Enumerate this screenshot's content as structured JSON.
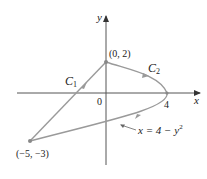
{
  "figure": {
    "axes": {
      "x_label": "x",
      "y_label": "y",
      "origin_label": "0",
      "x_tick_label": "4",
      "axis_color": "#555555"
    },
    "curves": {
      "C1": {
        "label": "C",
        "subscript": "1",
        "from": "(-5, -3)",
        "to": "(0, 2)",
        "type": "line segment"
      },
      "C2": {
        "label": "C",
        "subscript": "2",
        "type": "parabolic arc",
        "equation_lhs": "x = 4 − y",
        "equation_exp": "2"
      },
      "curve_color": "#9a9a9a"
    },
    "points": [
      {
        "label": "(0, 2)"
      },
      {
        "label": "(−5, −3)"
      }
    ]
  }
}
